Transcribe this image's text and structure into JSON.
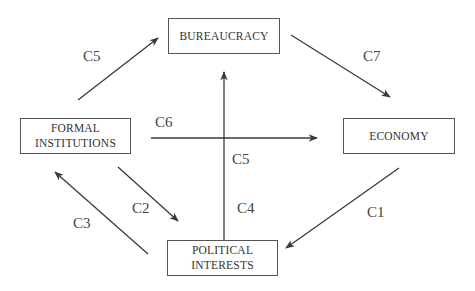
{
  "nodes": {
    "bureaucracy": {
      "label": "BUREAUCRACY"
    },
    "formal_institutions": {
      "line1": "FORMAL",
      "line2": "INSTITUTIONS"
    },
    "economy": {
      "label": "ECONOMY"
    },
    "political_interests": {
      "line1": "POLITICAL",
      "line2": "INTERESTS"
    }
  },
  "edges": [
    {
      "id": "C5a",
      "label": "C5",
      "from": "FORMAL INSTITUTIONS",
      "to": "BUREAUCRACY"
    },
    {
      "id": "C7",
      "label": "C7",
      "from": "BUREAUCRACY",
      "to": "ECONOMY"
    },
    {
      "id": "C6",
      "label": "C6",
      "from": "FORMAL INSTITUTIONS",
      "to": "ECONOMY"
    },
    {
      "id": "C5b",
      "label": "C5",
      "from": "POLITICAL INTERESTS",
      "to": "BUREAUCRACY"
    },
    {
      "id": "C4",
      "label": "C4",
      "from": "POLITICAL INTERESTS",
      "to": "BUREAUCRACY"
    },
    {
      "id": "C2",
      "label": "C2",
      "from": "FORMAL INSTITUTIONS",
      "to": "POLITICAL INTERESTS"
    },
    {
      "id": "C3",
      "label": "C3",
      "from": "POLITICAL INTERESTS",
      "to": "FORMAL INSTITUTIONS"
    },
    {
      "id": "C1",
      "label": "C1",
      "from": "ECONOMY",
      "to": "POLITICAL INTERESTS"
    }
  ],
  "colors": {
    "line": "#3a3a3a",
    "border": "#555555",
    "text": "#333333"
  }
}
